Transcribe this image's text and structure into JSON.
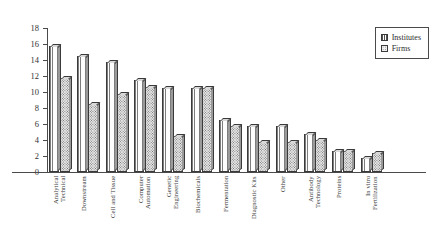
{
  "chart_data": {
    "type": "bar",
    "title": "",
    "xlabel": "",
    "ylabel": "",
    "ylim": [
      0,
      18
    ],
    "yticks": [
      0,
      2,
      4,
      6,
      8,
      10,
      12,
      14,
      16,
      18
    ],
    "grid": false,
    "legend_position": "top-right",
    "categories": [
      "Analytical\nTechnical",
      "Downstream",
      "Cell and Tissue",
      "Computer\nAutomation",
      "Genetic\nEngineering",
      "Biochemicals",
      "Fermentation",
      "Diagnostic Kits",
      "Other",
      "Antibody\nTechnology",
      "Proteins",
      "In vitro\nFertilization"
    ],
    "series": [
      {
        "name": "Institutes",
        "values": [
          15.7,
          14.5,
          13.7,
          11.5,
          10.5,
          10.5,
          6.5,
          5.7,
          5.7,
          4.7,
          2.6,
          1.7
        ]
      },
      {
        "name": "Firms",
        "values": [
          11.7,
          8.5,
          9.8,
          10.6,
          4.5,
          10.5,
          5.7,
          3.7,
          3.7,
          4.0,
          2.6,
          2.4
        ]
      }
    ]
  },
  "legend": {
    "items": [
      {
        "label": "Institutes",
        "swatch": "vertical-hatch-swatch"
      },
      {
        "label": "Firms",
        "swatch": "stipple-swatch"
      }
    ]
  },
  "axis": {
    "y_top_label": "18"
  }
}
